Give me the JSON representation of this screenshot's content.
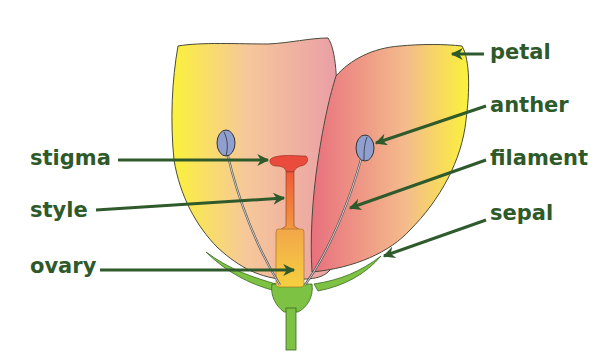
{
  "diagram": {
    "type": "labeled-illustration",
    "labels": [
      {
        "id": "petal",
        "text": "petal"
      },
      {
        "id": "anther",
        "text": "anther"
      },
      {
        "id": "filament",
        "text": "filament"
      },
      {
        "id": "sepal",
        "text": "sepal"
      },
      {
        "id": "stigma",
        "text": "stigma"
      },
      {
        "id": "style",
        "text": "style"
      },
      {
        "id": "ovary",
        "text": "ovary"
      }
    ],
    "colors": {
      "label_text": "#2e5a2a",
      "arrow": "#2f5a2c",
      "petal_yellow": "#fbf23a",
      "petal_pink": "#e88a92",
      "stigma_red": "#ea4b3c",
      "style_orange": "#f07a3c",
      "ovary_orange": "#f2b84a",
      "sepal_green": "#7dc242",
      "anther_blue": "#8f9fd0"
    }
  }
}
